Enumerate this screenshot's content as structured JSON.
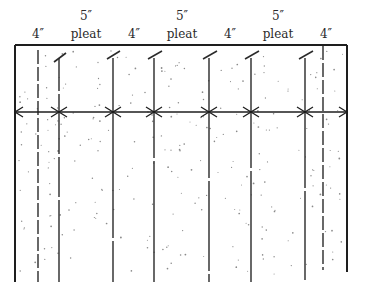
{
  "diagram": {
    "type": "pleat-layout",
    "labels": [
      {
        "text": "4″",
        "x": 38,
        "row": 2
      },
      {
        "top": "5″",
        "text": "pleat",
        "x": 86,
        "row": 2
      },
      {
        "text": "4″",
        "x": 134,
        "row": 2
      },
      {
        "top": "5″",
        "text": "pleat",
        "x": 182,
        "row": 2
      },
      {
        "text": "4″",
        "x": 230,
        "row": 2
      },
      {
        "top": "5″",
        "text": "pleat",
        "x": 278,
        "row": 2
      },
      {
        "text": "4″",
        "x": 326,
        "row": 2
      }
    ],
    "label_texts": {
      "l0": "4″",
      "l1_top": "5″",
      "l1": "pleat",
      "l2": "4″",
      "l3_top": "5″",
      "l3": "pleat",
      "l4": "4″",
      "l5_top": "5″",
      "l5": "pleat",
      "l6": "4″"
    },
    "fabric": {
      "left": 15,
      "right": 347,
      "top": 45,
      "bottom": 280,
      "right_bottom": 272
    },
    "measure_line_y": 112,
    "fold_lines": [
      {
        "x": 38,
        "style": "dashed",
        "tick": false
      },
      {
        "x": 59,
        "style": "solid",
        "tick": true
      },
      {
        "x": 113,
        "style": "solid",
        "tick": true
      },
      {
        "x": 154,
        "style": "solid",
        "tick": true
      },
      {
        "x": 209,
        "style": "solid",
        "tick": true
      },
      {
        "x": 251,
        "style": "solid",
        "tick": true
      },
      {
        "x": 305,
        "style": "solid",
        "tick": true
      },
      {
        "x": 323,
        "style": "dashed",
        "tick": false
      }
    ],
    "colors": {
      "ink": "#1e1e1e",
      "background": "#ffffff",
      "stipple": "#8a8a8a"
    }
  }
}
